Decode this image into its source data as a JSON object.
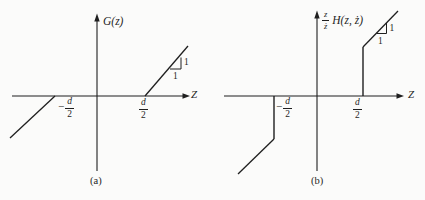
{
  "figure": {
    "background": "#fbfbfa",
    "ink": "#1f1f1f"
  },
  "panel_a": {
    "caption": "(a)",
    "y_axis_label": "G(z)",
    "x_axis_label": "Z",
    "neg_break": {
      "minus": "−",
      "num": "d",
      "den": "2"
    },
    "pos_break": {
      "num": "d",
      "den": "2"
    },
    "slope_rise": "1",
    "slope_run": "1",
    "curve": "G(z)=0 for |z| ≤ d/2; straight line of slope 1 for z > d/2 and z < −d/2 (dead-zone)"
  },
  "panel_b": {
    "caption": "(b)",
    "y_prefix": {
      "num": "z",
      "den": "ż"
    },
    "y_axis_label": "H(z, ż)",
    "x_axis_label": "Z",
    "neg_break": {
      "minus": "−",
      "num": "d",
      "den": "2"
    },
    "pos_break": {
      "num": "d",
      "den": "2"
    },
    "slope_rise": "1",
    "slope_run": "1",
    "curve": "zero for |z| < d/2; vertical jump at z = ±d/2 then straight line of slope 1"
  }
}
